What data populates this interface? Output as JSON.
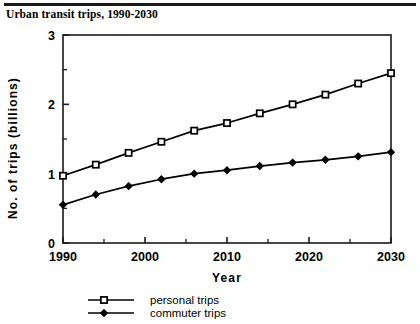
{
  "figure": {
    "title": "Urban transit trips, 1990-2030",
    "rule_color": "#1a1a1a"
  },
  "chart_data": {
    "type": "line",
    "title": "Urban transit trips, 1990-2030",
    "xlabel": "Year",
    "ylabel": "No. of trips  (billions)",
    "xlim": [
      1990,
      2030
    ],
    "ylim": [
      0,
      3
    ],
    "xticks": [
      1990,
      2000,
      2010,
      2020,
      2030
    ],
    "xtick_labels": [
      "1990",
      "2000",
      "2010",
      "2020",
      "2030"
    ],
    "xminor_ticks": [
      1995,
      2005,
      2015,
      2025
    ],
    "yticks": [
      0,
      1,
      2,
      3
    ],
    "ytick_labels": [
      "0",
      "1",
      "2",
      "3"
    ],
    "yminor_ticks": [
      0.5,
      1.5,
      2.5
    ],
    "grid": false,
    "legend_position": "below",
    "x": [
      1990,
      1994,
      1998,
      2002,
      2006,
      2010,
      2014,
      2018,
      2022,
      2026,
      2030
    ],
    "series": [
      {
        "name": "personal trips",
        "marker": "open-square",
        "color": "#000000",
        "values": [
          0.97,
          1.13,
          1.3,
          1.46,
          1.62,
          1.73,
          1.87,
          2.0,
          2.14,
          2.3,
          2.45
        ]
      },
      {
        "name": "commuter trips",
        "marker": "filled-diamond",
        "color": "#000000",
        "values": [
          0.55,
          0.7,
          0.82,
          0.92,
          1.0,
          1.05,
          1.11,
          1.16,
          1.2,
          1.25,
          1.31
        ]
      }
    ]
  },
  "legend": {
    "entries": [
      {
        "label": "personal trips",
        "marker": "open-square"
      },
      {
        "label": "commuter trips",
        "marker": "filled-diamond"
      }
    ]
  }
}
